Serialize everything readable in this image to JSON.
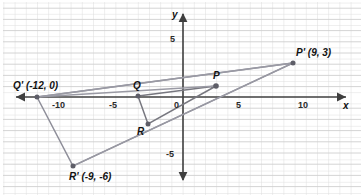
{
  "figure": {
    "type": "coordinate-plane-dilation",
    "width": 361,
    "height": 195,
    "background": "#ffffff",
    "grid": {
      "on": true,
      "minor_color": "#d9d9d9",
      "major_color": "#bdbdbd",
      "unit_px": 11.2,
      "origin_px": {
        "x": 183,
        "y": 97
      }
    },
    "axes": {
      "x_label": "x",
      "y_label": "y",
      "axis_color": "#3a3a3a",
      "x_range": [
        -15,
        15
      ],
      "y_range": [
        -8,
        8
      ],
      "x_ticks": [
        "-10",
        "-5",
        "0",
        "5",
        "10"
      ],
      "y_ticks": [
        "5",
        "-5"
      ]
    },
    "shape_color": "#8c8c96",
    "point_color": "#6e6e78",
    "preimage": {
      "name": "PQR",
      "vertices": [
        {
          "label": "P",
          "x": 3,
          "y": 1,
          "label_dx": -3,
          "label_dy": -13
        },
        {
          "label": "Q",
          "x": -4,
          "y": 0,
          "label_dx": -3,
          "label_dy": -14
        },
        {
          "label": "R",
          "x": -3,
          "y": -2.4,
          "label_dx": -10,
          "label_dy": 4
        }
      ]
    },
    "image": {
      "name": "P'Q'R'",
      "vertices": [
        {
          "label": "P' (9, 3)",
          "x": 9,
          "y": 3,
          "label_dx": 4,
          "label_dy": -16
        },
        {
          "label": "Q' (-12, 0)",
          "x": -13,
          "y": 0,
          "label_dx": -6,
          "label_dy": -16
        },
        {
          "label": "R' (-9, -6)",
          "x": -9.8,
          "y": -6.2,
          "label_dx": 0,
          "label_dy": 6
        }
      ]
    },
    "rays": [
      {
        "from": "Q'",
        "through": "Q",
        "to": "P"
      },
      {
        "from": "Q'",
        "through": "P",
        "to": "P'"
      },
      {
        "from": "R'",
        "through": "R",
        "to": "P'"
      }
    ],
    "labels": {
      "x_axis": "x",
      "y_axis": "y",
      "origin": "0",
      "tick_neg10": "-10",
      "tick_neg5": "-5",
      "tick_5": "5",
      "tick_10": "10",
      "tick_y5": "5",
      "tick_yneg5": "-5",
      "P": "P",
      "Q": "Q",
      "R": "R",
      "Pprime": "P' (9, 3)",
      "Qprime": "Q' (-12, 0)",
      "Rprime": "R' (-9, -6)"
    }
  }
}
